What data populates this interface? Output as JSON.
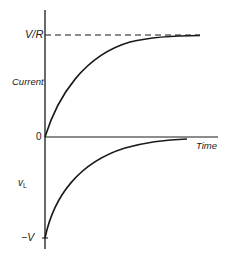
{
  "diagram": {
    "labels": {
      "current_axis": "Current",
      "steady_state": "V/R",
      "zero": "0",
      "time_axis": "Time",
      "vl_axis_main": "v",
      "vl_axis_sub": "L",
      "neg_v": "−V"
    },
    "curves": [
      {
        "name": "current",
        "description": "Exponential rise from 0 toward V/R",
        "start": "0",
        "asymptote": "V/R"
      },
      {
        "name": "inductor-voltage",
        "description": "Exponential decay from -V toward 0",
        "start": "-V",
        "asymptote": "0"
      }
    ],
    "colors": {
      "line": "#1a1a1a",
      "background": "#ffffff"
    }
  }
}
